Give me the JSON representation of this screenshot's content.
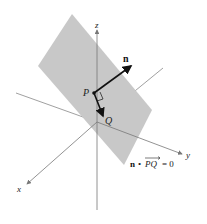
{
  "diagram": {
    "axes": {
      "x": "x",
      "y": "y",
      "z": "z"
    },
    "points": {
      "P": "P",
      "Q": "Q"
    },
    "normal_label": "n",
    "equation": {
      "n": "n",
      "dot": "•",
      "vec": "PQ",
      "eq": "= 0"
    },
    "colors": {
      "plane": "#c8c8c8",
      "axis": "#777777",
      "vector": "#111111"
    }
  }
}
